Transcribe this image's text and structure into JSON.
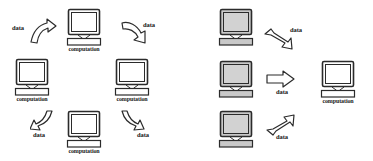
{
  "figure": {
    "background_color": "#ffffff",
    "stroke_color": "#2b2b2b",
    "screen_fill_light": "#ffffff",
    "screen_fill_shaded": "#d2d2d2",
    "case_fill_shaded": "#c9c9c9",
    "arrow_fill": "#ffffff"
  },
  "panels": [
    {
      "id": "move-computation-to-data",
      "nodes": [
        {
          "id": "top",
          "label": "computation",
          "shaded": false,
          "x": 64,
          "y": 8,
          "w": 40,
          "h": 38
        },
        {
          "id": "left",
          "label": "computation",
          "shaded": false,
          "x": 12,
          "y": 58,
          "w": 40,
          "h": 38
        },
        {
          "id": "right",
          "label": "computation",
          "shaded": false,
          "x": 112,
          "y": 58,
          "w": 40,
          "h": 38
        },
        {
          "id": "bottom",
          "label": "computation",
          "shaded": false,
          "x": 64,
          "y": 110,
          "w": 40,
          "h": 38
        }
      ],
      "flows": [
        {
          "id": "top-left",
          "label": "data",
          "direction": "up-right",
          "arrow_x": 28,
          "arrow_y": 18,
          "label_x": 12,
          "label_y": 24
        },
        {
          "id": "top-right",
          "label": "data",
          "direction": "down-right",
          "arrow_x": 120,
          "arrow_y": 20,
          "label_x": 143,
          "label_y": 21
        },
        {
          "id": "bottom-left",
          "label": "data",
          "direction": "down-left",
          "arrow_x": 30,
          "arrow_y": 110,
          "label_x": 33,
          "label_y": 131
        },
        {
          "id": "bottom-right",
          "label": "data",
          "direction": "down-right",
          "arrow_x": 117,
          "arrow_y": 110,
          "label_x": 137,
          "label_y": 131
        }
      ]
    },
    {
      "id": "move-data-to-computation",
      "nodes": [
        {
          "id": "source-top",
          "label": "",
          "shaded": true,
          "x": 30,
          "y": 8,
          "w": 40,
          "h": 38
        },
        {
          "id": "source-middle",
          "label": "",
          "shaded": true,
          "x": 30,
          "y": 60,
          "w": 40,
          "h": 38
        },
        {
          "id": "source-bottom",
          "label": "",
          "shaded": true,
          "x": 30,
          "y": 110,
          "w": 40,
          "h": 38
        },
        {
          "id": "target",
          "label": "computation",
          "shaded": false,
          "x": 132,
          "y": 60,
          "w": 40,
          "h": 38
        }
      ],
      "flows": [
        {
          "id": "from-top",
          "label": "data",
          "direction": "down-right",
          "arrow_x": 78,
          "arrow_y": 28,
          "label_x": 104,
          "label_y": 26
        },
        {
          "id": "from-middle",
          "label": "data",
          "direction": "right",
          "arrow_x": 80,
          "arrow_y": 70,
          "label_x": 90,
          "label_y": 88
        },
        {
          "id": "from-bottom",
          "label": "data",
          "direction": "up-right",
          "arrow_x": 80,
          "arrow_y": 112,
          "label_x": 90,
          "label_y": 133
        }
      ]
    }
  ]
}
